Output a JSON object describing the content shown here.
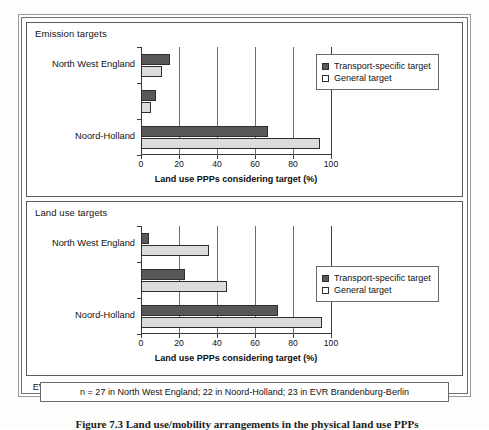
{
  "figure": {
    "footnote": "n = 27 in North West England; 22 in Noord-Holland; 23 in EVR Brandenburg-Berlin",
    "caption": "Figure 7.3  Land use/mobility arrangements in the physical land use PPPs"
  },
  "legend": {
    "series_dark": "Transport-specific target",
    "series_light": "General target",
    "swatch_dark_icon": "filled-square-icon",
    "swatch_light_icon": "empty-square-icon"
  },
  "panels": [
    {
      "id": "emission",
      "title": "Emission targets"
    },
    {
      "id": "landuse",
      "title": "Land use targets"
    }
  ],
  "axis": {
    "ticks": [
      "0",
      "20",
      "40",
      "60",
      "80",
      "100"
    ],
    "title": "Land use PPPs considering target (%)"
  },
  "chart_data": [
    {
      "type": "bar",
      "orientation": "horizontal",
      "title": "Emission targets",
      "xlabel": "Land use PPPs considering target (%)",
      "ylabel": "",
      "xlim": [
        0,
        100
      ],
      "xticks": [
        0,
        20,
        40,
        60,
        80,
        100
      ],
      "grid": true,
      "legend_position": "right",
      "categories": [
        "North West England",
        "Noord-Holland",
        "EVR Brandenburg-Berlin"
      ],
      "series": [
        {
          "name": "Transport-specific target",
          "values": [
            15,
            8,
            67
          ]
        },
        {
          "name": "General target",
          "values": [
            11,
            5,
            94
          ]
        }
      ]
    },
    {
      "type": "bar",
      "orientation": "horizontal",
      "title": "Land use targets",
      "xlabel": "Land use PPPs considering target (%)",
      "ylabel": "",
      "xlim": [
        0,
        100
      ],
      "xticks": [
        0,
        20,
        40,
        60,
        80,
        100
      ],
      "grid": true,
      "legend_position": "right",
      "categories": [
        "North West England",
        "Noord-Holland",
        "EVR Brandenburg-Berlin"
      ],
      "series": [
        {
          "name": "Transport-specific target",
          "values": [
            4,
            23,
            72
          ]
        },
        {
          "name": "General target",
          "values": [
            36,
            45,
            95
          ]
        }
      ]
    }
  ]
}
